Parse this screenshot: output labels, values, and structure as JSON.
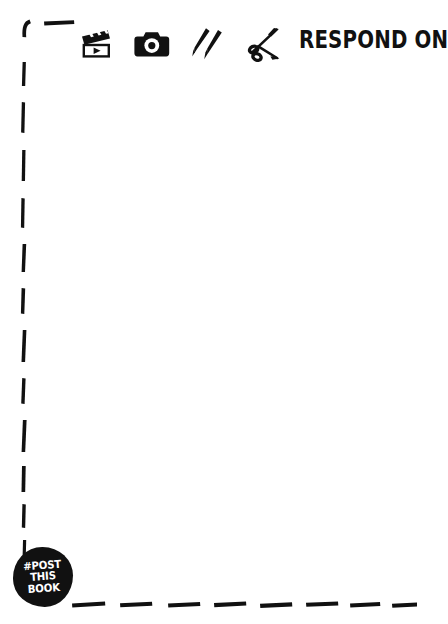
{
  "page": {
    "background_color": "#ffffff",
    "ink_color": "#111111"
  },
  "frame": {
    "style": "hand-drawn-dashed",
    "sides_visible": [
      "left",
      "bottom",
      "top-left-corner-stub"
    ],
    "color": "#111111"
  },
  "icon_row": {
    "icons": [
      {
        "name": "clapperboard-icon",
        "label": "video"
      },
      {
        "name": "camera-icon",
        "label": "photo"
      },
      {
        "name": "pens-icon",
        "label": "draw"
      },
      {
        "name": "scissors-icon",
        "label": "cut"
      }
    ]
  },
  "headline": {
    "text": "RESPOND ON",
    "clipped_at_right_edge": true
  },
  "stamp": {
    "line1": "#POST",
    "line2": "THIS",
    "line3": "BOOK",
    "fill_color": "#111111",
    "text_color": "#ffffff"
  }
}
